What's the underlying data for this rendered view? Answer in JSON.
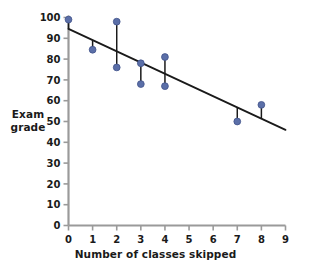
{
  "chart_data": {
    "type": "scatter",
    "title": "",
    "xlabel": "Number of classes skipped",
    "ylabel": "Exam grade",
    "ylabel_lines": [
      "Exam",
      "grade"
    ],
    "xlim": [
      0,
      9
    ],
    "ylim": [
      0,
      100
    ],
    "xticks": [
      0,
      1,
      2,
      3,
      4,
      5,
      6,
      7,
      8,
      9
    ],
    "yticks": [
      0,
      10,
      20,
      30,
      40,
      50,
      60,
      70,
      80,
      90,
      100
    ],
    "xtick_labels": [
      "0",
      "1",
      "2",
      "3",
      "4",
      "5",
      "6",
      "7",
      "8",
      "9"
    ],
    "ytick_labels": [
      "0",
      "10",
      "20",
      "30",
      "40",
      "50",
      "60",
      "70",
      "80",
      "90",
      "100"
    ],
    "grid": false,
    "legend": null,
    "points": [
      {
        "x": 0,
        "y": 99
      },
      {
        "x": 1,
        "y": 84.5
      },
      {
        "x": 2,
        "y": 98
      },
      {
        "x": 2,
        "y": 76
      },
      {
        "x": 3,
        "y": 78
      },
      {
        "x": 3,
        "y": 68
      },
      {
        "x": 4,
        "y": 81
      },
      {
        "x": 4,
        "y": 67
      },
      {
        "x": 7,
        "y": 50
      },
      {
        "x": 8,
        "y": 58
      }
    ],
    "fit_line": {
      "x0": 0,
      "y0": 94.5,
      "x1": 9,
      "y1": 46,
      "slope": -5.389,
      "intercept": 94.5
    },
    "residual_segments": [
      {
        "x": 0,
        "y_point": 99,
        "y_line": 94.5
      },
      {
        "x": 1,
        "y_point": 84.5,
        "y_line": 89.1
      },
      {
        "x": 2,
        "y_point": 98,
        "y_line": 83.7
      },
      {
        "x": 2,
        "y_point": 76,
        "y_line": 83.7
      },
      {
        "x": 3,
        "y_point": 78,
        "y_line": 78.3
      },
      {
        "x": 3,
        "y_point": 68,
        "y_line": 78.3
      },
      {
        "x": 4,
        "y_point": 81,
        "y_line": 72.9
      },
      {
        "x": 4,
        "y_point": 67,
        "y_line": 72.9
      },
      {
        "x": 7,
        "y_point": 50,
        "y_line": 56.8
      },
      {
        "x": 8,
        "y_point": 58,
        "y_line": 51.4
      }
    ],
    "colors": {
      "marker": "#5b6fa8",
      "marker_edge": "#41538a",
      "fit_line": "#1a1a1a",
      "residual": "#1a1a1a",
      "axis": "#9a9a9a",
      "text": "#1a1a1a",
      "background": "#ffffff"
    }
  }
}
